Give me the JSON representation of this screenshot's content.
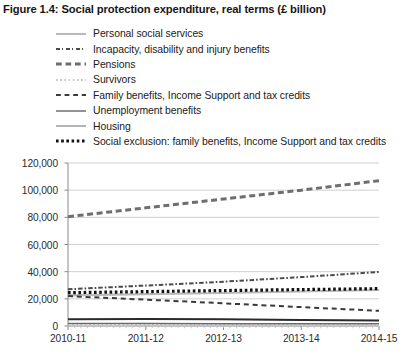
{
  "figure": {
    "title": "Figure 1.4: Social protection expenditure, real terms (£ billion)"
  },
  "legend": [
    {
      "label": "Personal social services",
      "style": "solid-light",
      "color": "#b9b9b9"
    },
    {
      "label": "Incapacity, disability and injury benefits",
      "style": "dashdot",
      "color": "#4a4a4a"
    },
    {
      "label": "Pensions",
      "style": "dash-thick",
      "color": "#6e6e6e"
    },
    {
      "label": "Survivors",
      "style": "dot-light",
      "color": "#c6c6c6"
    },
    {
      "label": "Family benefits, Income Support and tax credits",
      "style": "dash",
      "color": "#3a3a3a"
    },
    {
      "label": "Unemployment benefits",
      "style": "solid",
      "color": "#2a2a2a"
    },
    {
      "label": "Housing",
      "style": "solid-mid",
      "color": "#6a6a6a"
    },
    {
      "label": "Social exclusion: family benefits, Income Support and tax credits",
      "style": "dot-thick",
      "color": "#111111"
    }
  ],
  "chart_data": {
    "type": "line",
    "title": "Figure 1.4: Social protection expenditure, real terms (£ billion)",
    "xlabel": "",
    "ylabel": "",
    "categories": [
      "2010-11",
      "2011-12",
      "2012-13",
      "2013-14",
      "2014-15"
    ],
    "ylim": [
      0,
      120000
    ],
    "yticks": [
      0,
      20000,
      40000,
      60000,
      80000,
      100000,
      120000
    ],
    "ytick_labels": [
      "0",
      "20,000",
      "40,000",
      "60,000",
      "80,000",
      "100,000",
      "120,000"
    ],
    "grid": true,
    "legend_position": "above-plot",
    "series": [
      {
        "name": "Personal social services",
        "values": [
          22500,
          23400,
          24300,
          25400,
          26500
        ]
      },
      {
        "name": "Incapacity, disability and injury benefits",
        "values": [
          27000,
          29800,
          32600,
          36000,
          39800
        ]
      },
      {
        "name": "Pensions",
        "values": [
          80500,
          87000,
          93500,
          100000,
          107000
        ]
      },
      {
        "name": "Survivors",
        "values": [
          1200,
          1150,
          1100,
          1050,
          1000
        ]
      },
      {
        "name": "Family benefits, Income Support and tax credits",
        "values": [
          22000,
          19400,
          16700,
          13900,
          11200
        ]
      },
      {
        "name": "Unemployment benefits",
        "values": [
          5000,
          5100,
          4900,
          4500,
          4000
        ]
      },
      {
        "name": "Housing",
        "values": [
          1800,
          1750,
          1700,
          1650,
          1600
        ]
      },
      {
        "name": "Social exclusion: family benefits, Income Support and tax credits",
        "values": [
          24500,
          25300,
          26100,
          26800,
          27500
        ]
      }
    ]
  }
}
